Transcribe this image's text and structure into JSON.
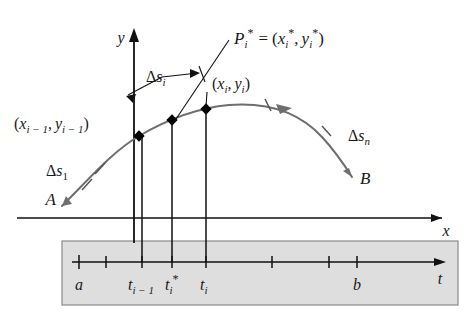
{
  "figure": {
    "colors": {
      "curve": "#6e6e6e",
      "axis": "#111111",
      "leader": "#111111",
      "text": "#1a1a1a",
      "panel_fill": "#dedede",
      "panel_border": "#8a8a8a",
      "point_fill": "#000000"
    }
  },
  "axes": {
    "y_label": "y",
    "x_label": "x",
    "t_label": "t"
  },
  "curve": {
    "start_label": "A",
    "end_label": "B",
    "direction": "left-to-right",
    "arrow": "curve-direction-arrow"
  },
  "labels": {
    "sample_point": {
      "p": "P",
      "p_sub": "i",
      "p_star": "*",
      "eq": "=",
      "open": "(",
      "x": "x",
      "x_sub": "i",
      "x_star": "*",
      "comma": ",",
      "y": "y",
      "y_sub": "i",
      "y_star": "*",
      "close": ")",
      "full_text": "P_i* = (x_i*, y_i*)"
    },
    "point_i": {
      "open": "(",
      "x": "x",
      "x_sub": "i",
      "comma": ",",
      "y": "y",
      "y_sub": "i",
      "close": ")",
      "full_text": "(x_i, y_i)"
    },
    "point_i_minus_1": {
      "open": "(",
      "x": "x",
      "x_sub": "i − 1",
      "comma": ",",
      "y": "y",
      "y_sub": "i − 1",
      "close": ")",
      "full_text": "(x_(i-1), y_(i-1))"
    },
    "delta_s_i": {
      "delta": "Δ",
      "s": "s",
      "sub": "i",
      "full_text": "Δs_i"
    },
    "delta_s_1": {
      "delta": "Δ",
      "s": "s",
      "sub": "1",
      "full_text": "Δs_1"
    },
    "delta_s_n": {
      "delta": "Δ",
      "s": "s",
      "sub": "n",
      "full_text": "Δs_n"
    }
  },
  "t_axis": {
    "ticks": [
      {
        "name": "a",
        "label": "a",
        "sub": "",
        "star": ""
      },
      {
        "name": "tick-2",
        "label": "",
        "sub": "",
        "star": ""
      },
      {
        "name": "t-i-minus-1",
        "label": "t",
        "sub": "i − 1",
        "star": ""
      },
      {
        "name": "t-i-star",
        "label": "t",
        "sub": "i",
        "star": "*"
      },
      {
        "name": "t-i",
        "label": "t",
        "sub": "i",
        "star": ""
      },
      {
        "name": "tick-6",
        "label": "",
        "sub": "",
        "star": ""
      },
      {
        "name": "tick-7",
        "label": "",
        "sub": "",
        "star": ""
      },
      {
        "name": "b",
        "label": "b",
        "sub": "",
        "star": ""
      }
    ]
  }
}
